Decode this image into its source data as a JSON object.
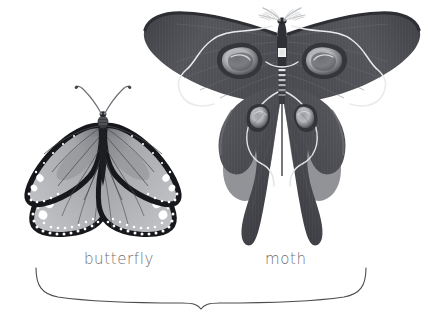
{
  "figure": {
    "background_color": "#ffffff",
    "width": 439,
    "height": 326
  },
  "specimens": [
    {
      "id": "butterfly",
      "label": "butterfly",
      "label_position": {
        "x": 84,
        "y": 250
      },
      "common_type": "monarch-style butterfly",
      "wing_color": "#8f9094",
      "wing_color_light": "#b9bbbe",
      "border_color": "#1d1d1f",
      "spot_color": "#ffffff",
      "vein_color": "#55565a",
      "antenna_type": "clubbed",
      "antenna_color": "#6b6c70",
      "center": {
        "x": 103,
        "y": 170
      },
      "wingspan": 168
    },
    {
      "id": "moth",
      "label": "moth",
      "label_position": {
        "x": 265,
        "y": 250
      },
      "common_type": "comet / luna moth",
      "wing_color": "#4e4f54",
      "wing_color_dark": "#3a3b40",
      "wing_color_light": "#6f7176",
      "eyespot_outer": "#2f3035",
      "eyespot_mid": "#b5b7ba",
      "eyespot_inner": "#7e8084",
      "accent_line_color": "#e8e9ea",
      "body_color": "#3a3b40",
      "antenna_type": "feathery",
      "antenna_color": "#c9cbcd",
      "center": {
        "x": 282,
        "y": 110
      },
      "wingspan": 268,
      "tail_length": 150
    }
  ],
  "brace": {
    "name": "grouping-brace",
    "stroke_color": "#4c4c50",
    "stroke_width": 1.1,
    "left_x": 36,
    "right_x": 366,
    "top_y": 268,
    "center_x": 201,
    "center_y": 308
  },
  "icons": {
    "butterfly_icon": "butterfly-illustration",
    "moth_icon": "moth-illustration",
    "brace_icon": "curly-brace"
  }
}
